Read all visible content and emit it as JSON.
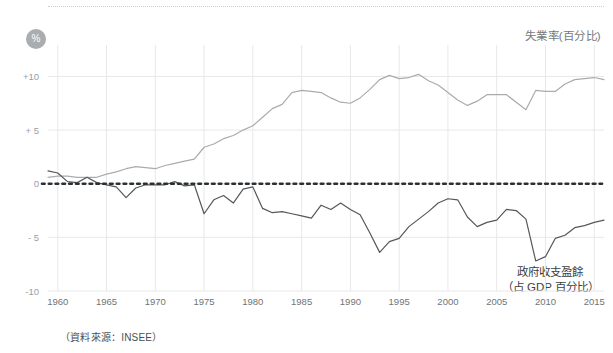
{
  "badge": {
    "symbol": "%"
  },
  "labels": {
    "unemployment": "失業率(百分比)",
    "deficit_line1": "政府收支盈餘",
    "deficit_line2": "（占 GDP 百分比）"
  },
  "source_note": "（資料來源：INSEE）",
  "colors": {
    "unemployment_line": "#a7acaf",
    "deficit_line": "#53585b",
    "zero_line": "#2b2f31",
    "grid": "#e8e8e8",
    "axis_text": "#6f7477",
    "badge_bg": "#a9adb0"
  },
  "chart_data": {
    "type": "line",
    "title": "",
    "xlabel": "",
    "ylabel": "%",
    "xlim": [
      1959,
      2016
    ],
    "ylim": [
      -10,
      12
    ],
    "yticks": [
      10,
      5,
      0,
      -5,
      -10
    ],
    "ytick_labels": [
      "+10",
      "+ 5",
      "0",
      "- 5",
      "-10"
    ],
    "xticks": [
      1960,
      1965,
      1970,
      1975,
      1980,
      1985,
      1990,
      1995,
      2000,
      2005,
      2010,
      2015
    ],
    "xtick_labels": [
      "1960",
      "1965",
      "1970",
      "1975",
      "1980",
      "1985",
      "1990",
      "1995",
      "2000",
      "2005",
      "2010",
      "2015"
    ],
    "grid": true,
    "legend_position": "inline-annotations",
    "zero_reference_line": 0,
    "x": [
      1959,
      1960,
      1961,
      1962,
      1963,
      1964,
      1965,
      1966,
      1967,
      1968,
      1969,
      1970,
      1971,
      1972,
      1973,
      1974,
      1975,
      1976,
      1977,
      1978,
      1979,
      1980,
      1981,
      1982,
      1983,
      1984,
      1985,
      1986,
      1987,
      1988,
      1989,
      1990,
      1991,
      1992,
      1993,
      1994,
      1995,
      1996,
      1997,
      1998,
      1999,
      2000,
      2001,
      2002,
      2003,
      2004,
      2005,
      2006,
      2007,
      2008,
      2009,
      2010,
      2011,
      2012,
      2013,
      2014,
      2015,
      2016
    ],
    "series": [
      {
        "name": "失業率(百分比)",
        "color": "#a7acaf",
        "values": [
          0.6,
          0.7,
          0.7,
          0.6,
          0.6,
          0.6,
          0.9,
          1.1,
          1.4,
          1.6,
          1.5,
          1.4,
          1.7,
          1.9,
          2.1,
          2.3,
          3.4,
          3.7,
          4.2,
          4.5,
          5.0,
          5.4,
          6.2,
          7.0,
          7.4,
          8.5,
          8.7,
          8.6,
          8.5,
          8.0,
          7.6,
          7.5,
          8.0,
          8.8,
          9.7,
          10.1,
          9.8,
          9.9,
          10.2,
          9.6,
          9.2,
          8.5,
          7.8,
          7.3,
          7.7,
          8.3,
          8.3,
          8.3,
          7.6,
          6.9,
          8.7,
          8.6,
          8.6,
          9.3,
          9.7,
          9.8,
          9.9,
          9.7
        ]
      },
      {
        "name": "政府收支盈餘（占 GDP 百分比）",
        "color": "#53585b",
        "values": [
          1.2,
          1.0,
          0.2,
          0.1,
          0.6,
          0.1,
          -0.1,
          -0.3,
          -1.3,
          -0.4,
          -0.1,
          -0.1,
          -0.1,
          0.2,
          -0.2,
          -0.1,
          -2.8,
          -1.5,
          -1.1,
          -1.8,
          -0.5,
          -0.3,
          -2.3,
          -2.7,
          -2.6,
          -2.8,
          -3.0,
          -3.2,
          -2.0,
          -2.4,
          -1.8,
          -2.4,
          -2.9,
          -4.6,
          -6.4,
          -5.4,
          -5.1,
          -4.0,
          -3.3,
          -2.6,
          -1.8,
          -1.4,
          -1.5,
          -3.1,
          -4.0,
          -3.6,
          -3.4,
          -2.4,
          -2.5,
          -3.3,
          -7.2,
          -6.8,
          -5.1,
          -4.8,
          -4.1,
          -3.9,
          -3.6,
          -3.4
        ]
      }
    ]
  }
}
